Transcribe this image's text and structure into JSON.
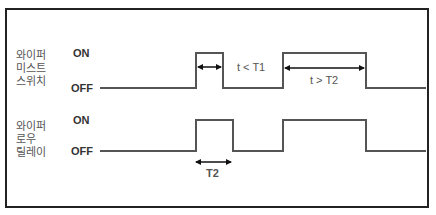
{
  "signals": [
    {
      "name": "wiper-mist-switch",
      "label_lines": [
        "와이퍼",
        "미스트",
        "스위치"
      ],
      "on_label": "ON",
      "off_label": "OFF"
    },
    {
      "name": "wiper-low-relay",
      "label_lines": [
        "와이퍼",
        "로우",
        "릴레이"
      ],
      "on_label": "ON",
      "off_label": "OFF"
    }
  ],
  "annotations": {
    "short_pulse": "t < T1",
    "long_pulse": "t > T2",
    "relay_duration": "T2"
  },
  "colors": {
    "frame": "#222222",
    "signal": "#555555",
    "arrow": "#111111"
  }
}
